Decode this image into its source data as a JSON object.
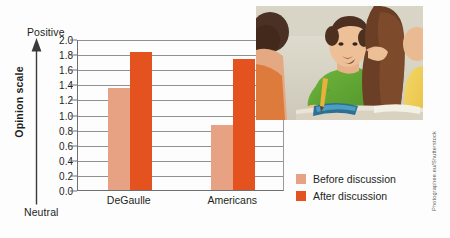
{
  "axis": {
    "positive_label": "Positive",
    "neutral_label": "Neutral",
    "y_axis_title": "Opinion scale"
  },
  "legend": {
    "before_label": "Before discussion",
    "after_label": "After discussion"
  },
  "credit": {
    "text": "Photographee.eu/Shutterstock"
  },
  "colors": {
    "before": "#e7a183",
    "after": "#e4531f",
    "axis": "#6f7072",
    "grid": "#8e9093",
    "text": "#231f20"
  },
  "chart_data": {
    "type": "bar",
    "title": "",
    "xlabel": "",
    "ylabel": "Opinion scale",
    "categories": [
      "DeGaulle",
      "Americans"
    ],
    "series": [
      {
        "name": "Before discussion",
        "values": [
          1.35,
          0.86
        ]
      },
      {
        "name": "After discussion",
        "values": [
          1.83,
          1.73
        ]
      }
    ],
    "ylim": [
      0.0,
      2.0
    ],
    "ytick_step": 0.2,
    "ytick_labels": [
      "2.0",
      "1.8",
      "1.6",
      "1.4",
      "1.2",
      "1.0",
      "0.8",
      "0.6",
      "0.4",
      "0.2",
      "0.0"
    ],
    "ytick_values": [
      2.0,
      1.8,
      1.6,
      1.4,
      1.2,
      1.0,
      0.8,
      0.6,
      0.4,
      0.2,
      0.0
    ],
    "axis_endpoint_labels": {
      "high": "Positive",
      "low": "Neutral"
    },
    "grid": "horizontal",
    "legend_position": "right-bottom"
  }
}
